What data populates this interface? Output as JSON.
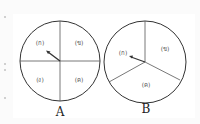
{
  "spinners": [
    {
      "caption": "A",
      "sections": [
        "(ก)",
        "(ข)",
        "(ค)",
        "(ง)"
      ]
    },
    {
      "caption": "B",
      "sections": [
        "(ก)",
        "(ข)",
        "(ค)"
      ]
    }
  ],
  "colors": {
    "stroke": "#333333",
    "background": "#ffffff"
  }
}
